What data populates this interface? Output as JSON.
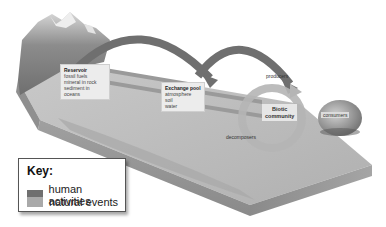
{
  "diagram": {
    "reservoir": {
      "title": "Reservoir",
      "items": [
        "fossil fuels",
        "mineral in rock",
        "sediment in oceans"
      ]
    },
    "exchange_pool": {
      "title": "Exchange pool",
      "items": [
        "atmosphere",
        "soil",
        "water"
      ]
    },
    "biotic_community": {
      "title_line1": "Biotic",
      "title_line2": "community"
    },
    "labels": {
      "producers": "producers",
      "consumers": "consumers",
      "decomposers": "decomposers"
    },
    "colors": {
      "human_activities": "#6f6f6f",
      "natural_events": "#a9a9a9",
      "ground_top": "#bdbdbd",
      "ground_side": "#8e8e8e",
      "background": "#ffffff"
    }
  },
  "key": {
    "title": "Key:",
    "items": [
      {
        "label": "human activities",
        "color": "#6f6f6f"
      },
      {
        "label": "natural events",
        "color": "#a9a9a9"
      }
    ]
  }
}
